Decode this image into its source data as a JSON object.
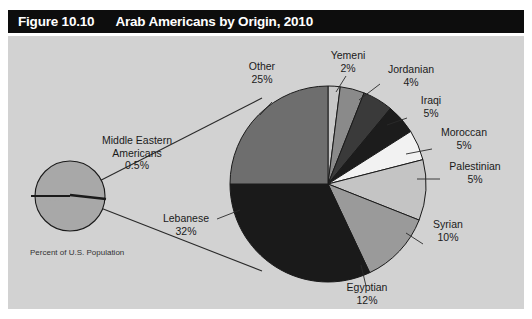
{
  "figure": {
    "number": "Figure 10.10",
    "title": "Arab Americans by Origin, 2010"
  },
  "caption": "Percent of U.S. Population",
  "small_circle": {
    "label_line1": "Middle Eastern",
    "label_line2": "Americans",
    "value": "0.5%"
  },
  "colors": {
    "panel_background": "#d2d2d2",
    "title_bar": "#0d0d0d",
    "title_text": "#ffffff",
    "outline": "#1a1a1a",
    "small_circle_fill": "#a8a8a8"
  },
  "chart_data": {
    "type": "pie",
    "title": "Arab Americans by Origin, 2010",
    "unit": "percent",
    "total_note": "Percent of U.S. Population",
    "categories": [
      "Yemeni",
      "Jordanian",
      "Iraqi",
      "Moroccan",
      "Palestinian",
      "Syrian",
      "Egyptian",
      "Lebanese",
      "Other"
    ],
    "values": [
      2,
      4,
      5,
      5,
      5,
      10,
      12,
      32,
      25
    ],
    "labels": [
      {
        "name": "Yemeni",
        "value": 2,
        "display": "2%",
        "color": "#c8c8c8"
      },
      {
        "name": "Jordanian",
        "value": 4,
        "display": "4%",
        "color": "#8a8a8a"
      },
      {
        "name": "Iraqi",
        "value": 5,
        "display": "5%",
        "color": "#3a3a3a"
      },
      {
        "name": "Moroccan",
        "value": 5,
        "display": "5%",
        "color": "#1c1c1c"
      },
      {
        "name": "Palestinian",
        "value": 5,
        "display": "5%",
        "color": "#f2f2f2"
      },
      {
        "name": "Syrian",
        "value": 10,
        "display": "10%",
        "color": "#c4c4c4"
      },
      {
        "name": "Egyptian",
        "value": 12,
        "display": "12%",
        "color": "#9a9a9a"
      },
      {
        "name": "Lebanese",
        "value": 32,
        "display": "32%",
        "color": "#1a1a1a"
      },
      {
        "name": "Other",
        "value": 25,
        "display": "25%",
        "color": "#6e6e6e"
      }
    ],
    "legend": "none",
    "start_angle_deg": -90,
    "direction": "clockwise"
  }
}
